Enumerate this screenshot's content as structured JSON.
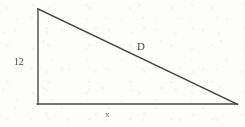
{
  "figure": {
    "kind": "right-triangle-diagram",
    "background_color": "#fdfdfc",
    "stroke_color": "#4a4a4d",
    "labels": {
      "vertical_leg": "12",
      "hypotenuse": "D",
      "base": "x"
    },
    "geometry": {
      "apex": [
        38,
        9
      ],
      "right_angle_corner": [
        38,
        104
      ],
      "right_vertex": [
        237,
        104
      ],
      "vertical_leg_points": "38,9 38,104",
      "base_points": "38,104 237,104",
      "hypotenuse_points": "38,9 237,104"
    }
  }
}
